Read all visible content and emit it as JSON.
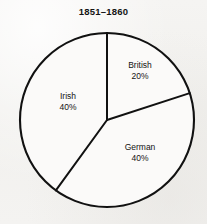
{
  "chart_data": {
    "type": "pie",
    "title": "1851–1860",
    "xlabel": "",
    "ylabel": "",
    "categories": [
      "British",
      "German",
      "Irish"
    ],
    "values": [
      20,
      40,
      40
    ],
    "value_labels": [
      "20%",
      "40%",
      "40%"
    ],
    "units": "percent",
    "total": 100,
    "legend_position": "none",
    "labels_inside_slices": true,
    "grid": false,
    "slice_fill": "none",
    "stroke_color": "#111111",
    "start_angle_deg": 0,
    "direction": "clockwise",
    "slices": [
      {
        "name": "British",
        "value": 20,
        "value_label": "20%",
        "start_angle_deg": 0,
        "end_angle_deg": 72,
        "label_x": 140,
        "label_y": 71
      },
      {
        "name": "German",
        "value": 40,
        "value_label": "40%",
        "start_angle_deg": 72,
        "end_angle_deg": 216,
        "label_x": 140,
        "label_y": 153
      },
      {
        "name": "Irish",
        "value": 40,
        "value_label": "40%",
        "start_angle_deg": 216,
        "end_angle_deg": 360,
        "label_x": 68,
        "label_y": 102
      }
    ]
  },
  "figure": {
    "background_color": "#f3f2f0",
    "center_x": 107,
    "center_y": 120,
    "radius": 87
  }
}
